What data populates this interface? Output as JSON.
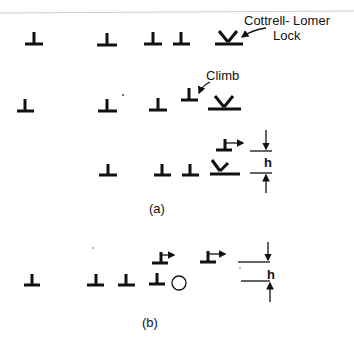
{
  "figure": {
    "annotations": {
      "cottrell_lomer_line1": "Cottrell- Lomer",
      "cottrell_lomer_line2": "Lock",
      "climb": "Climb",
      "height_a": "h",
      "height_b": "h"
    },
    "panels": [
      {
        "caption": "(a)"
      },
      {
        "caption": "(b)"
      }
    ],
    "symbols": {
      "edge_dislocation": "⊥",
      "vacancy": "○"
    },
    "colors": {
      "ink": "#111111",
      "background": "#ffffff"
    }
  }
}
